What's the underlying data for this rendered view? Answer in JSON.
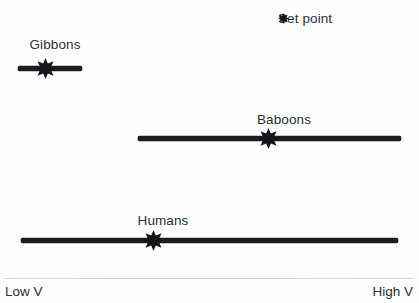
{
  "figure": {
    "background_color": "#fefefe",
    "marker_color": "#141619",
    "bar_color": "#1b1d21",
    "text_color": "#2b2f33",
    "axis_color": "#d0d3d7"
  },
  "legend": {
    "marker_name": "set-point-star-icon",
    "label": "Set point",
    "x": 278,
    "y": 12
  },
  "axis": {
    "left_label": "Low V",
    "right_label": "High V",
    "line_y": 278,
    "line_left": 4,
    "line_right": 414,
    "label_y": 285
  },
  "chart_data": {
    "type": "range-dot",
    "title": "",
    "xlabel": "",
    "ylabel": "",
    "xlim": [
      0,
      100
    ],
    "grid": false,
    "legend_position": "top-right",
    "legend_entries": [
      "Set point"
    ],
    "axis_tick_labels": [
      "Low V",
      "High V"
    ],
    "categories": [
      "Gibbons",
      "Baboons",
      "Humans"
    ],
    "series": [
      {
        "name": "Gibbons",
        "label": "Gibbons",
        "range_start": 18,
        "range_end": 82,
        "set_point": 45,
        "bar_y": 66,
        "label_x": 55,
        "label_y": 38
      },
      {
        "name": "Baboons",
        "label": "Baboons",
        "range_start": 138,
        "range_end": 401,
        "set_point": 268,
        "bar_y": 136,
        "label_x": 284,
        "label_y": 113
      },
      {
        "name": "Humans",
        "label": "Humans",
        "range_start": 21,
        "range_end": 398,
        "set_point": 153,
        "bar_y": 238,
        "label_x": 163,
        "label_y": 214
      }
    ]
  }
}
